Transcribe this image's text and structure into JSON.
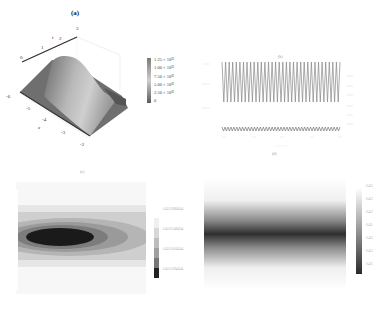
{
  "panels": {
    "a": {
      "label": "(a)",
      "t_axis_label": "t",
      "t_ticks": [
        "0",
        "1",
        "2",
        "3"
      ],
      "x_axis_label": "x",
      "x_ticks": [
        "-6",
        "-5",
        "-4",
        "-3",
        "-2"
      ],
      "colorbar_ticks": [
        "1.25 × 10¹³",
        "1.00 × 10¹³",
        "7.50 × 10¹²",
        "5.00 × 10¹²",
        "2.50 × 10¹²",
        "0"
      ]
    },
    "b": {
      "label": "(b)",
      "y_ticks": [
        "",
        "",
        ""
      ],
      "x_ticks": [
        "",
        "",
        "",
        "",
        ""
      ],
      "x_axis_label": "",
      "right_ticks": [
        "",
        "",
        "",
        "",
        "",
        ""
      ]
    },
    "c": {
      "label": "(c)",
      "colorbar_ticks": [
        "0.451516804544",
        "0.451515484544",
        "0.451514164544",
        "0.451512844544"
      ],
      "y_ticks": [
        "",
        "",
        "",
        "",
        "",
        "",
        ""
      ],
      "x_ticks": [
        "",
        "",
        "",
        "",
        ""
      ]
    },
    "d": {
      "label": "(d)",
      "colorbar_ticks": [
        "0.451",
        "0.451",
        "0.451",
        "0.451",
        "0.451",
        "0.451",
        "0.451"
      ],
      "y_ticks": [
        "",
        "",
        "",
        "",
        "",
        "",
        ""
      ],
      "x_ticks": [
        "",
        "",
        "",
        "",
        ""
      ]
    }
  },
  "chart_data": [
    {
      "type": "surface3d",
      "title": "(a)",
      "xlabel": "x",
      "ylabel": "t",
      "x_range": [
        -6,
        -2
      ],
      "t_range": [
        0,
        3
      ],
      "z_range": [
        0,
        12500000000000.0
      ],
      "colorbar_ticks": [
        0,
        2500000000000.0,
        5000000000000.0,
        7500000000000.0,
        10000000000000.0,
        12500000000000.0
      ],
      "description": "Solitary ridge surface peaking near 1.25e13, ridge running along t direction"
    },
    {
      "type": "line",
      "title": "(b)",
      "series": [
        {
          "name": "upper oscillation",
          "description": "dense periodic oscillation, ~33 cycles, large amplitude"
        },
        {
          "name": "lower oscillation",
          "description": "dense periodic oscillation, small amplitude near bottom"
        }
      ],
      "grid": false
    },
    {
      "type": "heatmap",
      "title": "(c)",
      "style": "contour",
      "colorbar_ticks": [
        0.451512844544,
        0.451514164544,
        0.451515484544,
        0.451516804544
      ],
      "description": "Elliptical dark core on left-center, contour bands widening to the right"
    },
    {
      "type": "heatmap",
      "title": "(d)",
      "style": "density",
      "colorbar_ticks": [
        0.451,
        0.451,
        0.451,
        0.451,
        0.451,
        0.451,
        0.451
      ],
      "description": "Horizontal dark band across middle fading to white top and bottom"
    }
  ]
}
